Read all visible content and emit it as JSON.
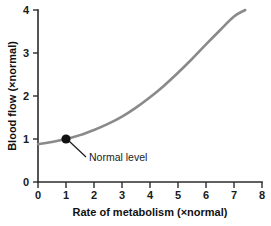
{
  "chart_data": {
    "type": "line",
    "title": "",
    "xlabel": "Rate of metabolism (×normal)",
    "ylabel": "Blood flow (×normal)",
    "xlim": [
      0,
      8
    ],
    "ylim": [
      0,
      4
    ],
    "xticks": [
      "0",
      "1",
      "2",
      "3",
      "4",
      "5",
      "6",
      "7",
      "8"
    ],
    "yticks": [
      "0",
      "1",
      "2",
      "3",
      "4"
    ],
    "grid": false,
    "legend": null,
    "series": [
      {
        "name": "Blood flow vs rate of metabolism",
        "color": "#8a8a8a",
        "x": [
          0.0,
          0.5,
          1.0,
          1.5,
          2.0,
          2.5,
          3.0,
          3.5,
          4.0,
          4.5,
          5.0,
          5.5,
          6.0,
          6.5,
          7.0,
          7.4
        ],
        "y": [
          0.88,
          0.93,
          1.0,
          1.09,
          1.21,
          1.35,
          1.52,
          1.73,
          1.97,
          2.24,
          2.54,
          2.86,
          3.2,
          3.53,
          3.85,
          4.0
        ]
      }
    ],
    "annotations": [
      {
        "label": "Normal level",
        "point_x": 1.0,
        "point_y": 1.0,
        "marker": "filled-circle",
        "marker_color": "#111111"
      }
    ]
  },
  "axes": {
    "x_title": "Rate of metabolism (×normal)",
    "y_title": "Blood flow (×normal)",
    "x_tick_labels": [
      "0",
      "1",
      "2",
      "3",
      "4",
      "5",
      "6",
      "7",
      "8"
    ],
    "y_tick_labels": [
      "0",
      "1",
      "2",
      "3",
      "4"
    ]
  },
  "annotation": {
    "normal_level_label": "Normal level"
  },
  "colors": {
    "curve": "#8a8a8a",
    "axis": "#2b2b2b",
    "text": "#1a1a1a",
    "marker": "#111111",
    "background": "#ffffff"
  }
}
